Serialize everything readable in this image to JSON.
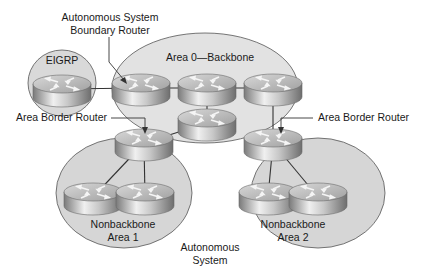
{
  "diagram": {
    "colors": {
      "area_fill": "#d9d9d9",
      "area_stroke": "#555555",
      "link": "#333333",
      "router_light": "#f2f2f2",
      "router_dark": "#8c8c8c"
    },
    "areas": [
      {
        "id": "eigrp",
        "label": "EIGRP"
      },
      {
        "id": "area0",
        "label": "Area 0—Backbone"
      },
      {
        "id": "area1",
        "label_line1": "Nonbackbone",
        "label_line2": "Area 1"
      },
      {
        "id": "area2",
        "label_line1": "Nonbackbone",
        "label_line2": "Area 2"
      }
    ],
    "annotations": {
      "asbr_line1": "Autonomous System",
      "asbr_line2": "Boundary Router",
      "abr_left": "Area Border Router",
      "abr_right": "Area Border Router",
      "as_line1": "Autonomous",
      "as_line2": "System"
    },
    "routers": [
      {
        "id": "eigrp-router",
        "x": 62,
        "y": 89
      },
      {
        "id": "asbr",
        "x": 141,
        "y": 88
      },
      {
        "id": "area0-middle",
        "x": 207,
        "y": 88
      },
      {
        "id": "area0-right",
        "x": 273,
        "y": 88
      },
      {
        "id": "area0-lower",
        "x": 207,
        "y": 123
      },
      {
        "id": "abr-area1",
        "x": 144,
        "y": 143
      },
      {
        "id": "abr-area2",
        "x": 273,
        "y": 143
      },
      {
        "id": "area1-left",
        "x": 93,
        "y": 197
      },
      {
        "id": "area1-right",
        "x": 145,
        "y": 197
      },
      {
        "id": "area2-left",
        "x": 268,
        "y": 197
      },
      {
        "id": "area2-right",
        "x": 318,
        "y": 197
      }
    ],
    "links": [
      [
        "eigrp-router",
        "asbr"
      ],
      [
        "asbr",
        "area0-middle"
      ],
      [
        "area0-middle",
        "area0-right"
      ],
      [
        "area0-middle",
        "area0-lower"
      ],
      [
        "area0-lower",
        "abr-area1"
      ],
      [
        "area0-right",
        "abr-area2"
      ],
      [
        "abr-area1",
        "area1-left"
      ],
      [
        "abr-area1",
        "area1-right"
      ],
      [
        "abr-area2",
        "area2-left"
      ],
      [
        "abr-area2",
        "area2-right"
      ],
      [
        "area2-left",
        "area2-right"
      ]
    ]
  }
}
